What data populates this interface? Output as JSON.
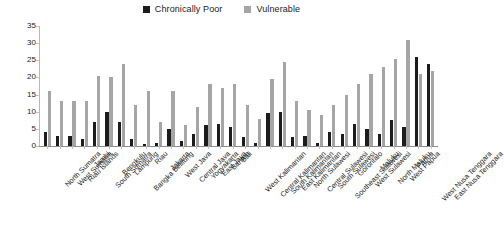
{
  "legend": {
    "position": "top-center",
    "entries": [
      {
        "label": "Chronically Poor",
        "color": "#1c1c1c",
        "icon": "square-swatch-icon"
      },
      {
        "label": "Vulnerable",
        "color": "#a5a5a5",
        "icon": "square-swatch-icon"
      }
    ]
  },
  "chart_data": {
    "type": "bar",
    "title": "",
    "subtitle": "",
    "xlabel": "",
    "ylabel": "",
    "ylim": [
      0,
      35
    ],
    "yticks": [
      0,
      5,
      10,
      15,
      20,
      25,
      30,
      35
    ],
    "grid": false,
    "legend_position": "top-center",
    "orientation": "vertical",
    "categories": [
      "North Sumatra",
      "West Sumatra",
      "Riau Islands",
      "Jambi",
      "South Sumatra",
      "Bengkulu",
      "Lampung",
      "Bangka Belitung",
      "Riau",
      "Jakarta",
      "West Java",
      "Central Java",
      "Yogyakarta",
      "East Java",
      "Banten",
      "Bali",
      "West Kalimantan",
      "Central Kalimantan",
      "South Kalimantan",
      "East Kalimantan",
      "North Sulawesi",
      "Central Sulawesi",
      "South Sulawesi",
      "Southeast Sulawesi",
      "Gorontalo",
      "West Sulawesi",
      "Maluku",
      "North Maluku",
      "West Papua",
      "Papua",
      "West Nusa Tenggara",
      "East Nusa Tenggara"
    ],
    "series": [
      {
        "name": "Chronically Poor",
        "color": "#1c1c1c",
        "values": [
          4.0,
          3.0,
          3.0,
          2.0,
          7.0,
          10.0,
          7.0,
          2.0,
          0.7,
          1.0,
          5.0,
          1.5,
          3.5,
          6.0,
          6.5,
          5.5,
          2.5,
          1.0,
          9.5,
          10.0,
          2.5,
          3.0,
          1.0,
          4.0,
          3.5,
          6.5,
          5.0,
          3.5,
          7.5,
          5.5,
          26.0,
          24.0
        ]
      },
      {
        "name": "Vulnerable",
        "color": "#a5a5a5",
        "values": [
          16.0,
          13.0,
          13.0,
          13.0,
          20.5,
          20.0,
          24.0,
          12.0,
          16.0,
          7.0,
          16.0,
          6.0,
          11.5,
          18.0,
          17.0,
          18.0,
          12.0,
          8.0,
          19.5,
          24.5,
          13.0,
          10.5,
          9.0,
          12.0,
          15.0,
          18.0,
          21.0,
          23.0,
          25.5,
          31.0,
          21.0,
          22.0
        ]
      }
    ]
  }
}
